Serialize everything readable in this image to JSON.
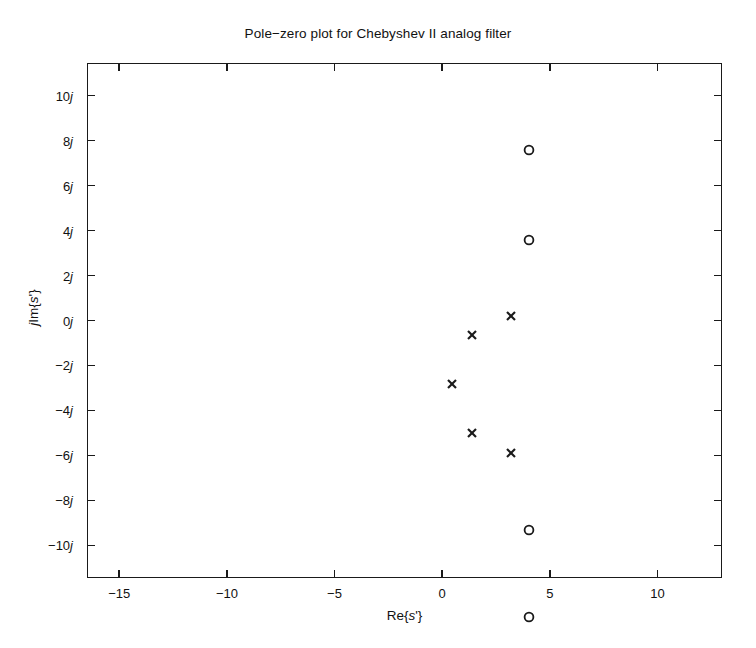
{
  "chart_data": {
    "type": "scatter",
    "title": "Pole−zero plot for Chebyshev II analog filter",
    "xlabel": "Re{s'}",
    "ylabel": "jIm{s'}",
    "xlim": [
      -16.5,
      13.0
    ],
    "ylim": [
      -11.45,
      11.45
    ],
    "grid": false,
    "legend": "none",
    "xticks": [
      -15,
      -10,
      -5,
      0,
      5,
      10
    ],
    "xticklabels": [
      "−15",
      "−10",
      "−5",
      "0",
      "5",
      "10"
    ],
    "yticks": [
      10,
      8,
      6,
      4,
      2,
      0,
      -2,
      -4,
      -6,
      -8,
      -10
    ],
    "yticklabels": [
      "10j",
      "8j",
      "6j",
      "4j",
      "2j",
      "0j",
      "−2j",
      "−4j",
      "−6j",
      "−8j",
      "−10j"
    ],
    "series": [
      {
        "name": "poles",
        "marker": "x",
        "points": [
          {
            "re": -3.6,
            "im": 0.0
          },
          {
            "re": -2.65,
            "im": 2.15
          },
          {
            "re": -0.85,
            "im": 3.0
          },
          {
            "re": -2.65,
            "im": -2.2
          },
          {
            "re": -0.85,
            "im": -3.1
          }
        ]
      },
      {
        "name": "zeros",
        "marker": "o",
        "points": [
          {
            "re": 0.0,
            "im": 10.4
          },
          {
            "re": 0.0,
            "im": 6.4
          },
          {
            "re": 0.0,
            "im": -6.5
          },
          {
            "re": 0.0,
            "im": -10.4
          }
        ]
      }
    ],
    "colors": {
      "axis": "#1a1a1a",
      "marker": "#1a1a1a",
      "background": "#ffffff"
    }
  }
}
